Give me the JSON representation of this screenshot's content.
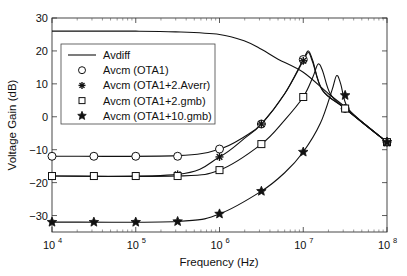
{
  "chart_data": {
    "type": "line",
    "title": "",
    "xlabel": "Frequency (Hz)",
    "ylabel": "Voltage Gain (dB)",
    "xscale": "log",
    "xlim": [
      10000,
      100000000
    ],
    "ylim": [
      -35,
      30
    ],
    "grid": false,
    "legend_position": "upper-left (inside)",
    "x_ticks": [
      10000,
      100000,
      1000000,
      10000000,
      100000000
    ],
    "x_tick_labels": [
      "10^4",
      "10^5",
      "10^6",
      "10^7",
      "10^8"
    ],
    "y_ticks": [
      -30,
      -20,
      -10,
      0,
      10,
      20,
      30
    ],
    "y_tick_labels": [
      "-30",
      "-20",
      "-10",
      "0",
      "10",
      "20",
      "30"
    ],
    "marker_x": [
      10000,
      31623,
      100000,
      316228,
      1000000,
      3162278,
      10000000,
      31622777,
      100000000
    ],
    "series": [
      {
        "name": "Avdiff",
        "marker": "none",
        "curve": [
          [
            10000,
            26
          ],
          [
            100000,
            26
          ],
          [
            300000,
            25.8
          ],
          [
            1000000,
            25
          ],
          [
            2000000,
            23
          ],
          [
            3162278,
            20.5
          ],
          [
            5000000,
            17.5
          ],
          [
            10000000,
            13.5
          ],
          [
            20000000,
            7
          ],
          [
            31622777,
            3
          ],
          [
            50000000,
            -1.5
          ],
          [
            100000000,
            -7.7
          ]
        ]
      },
      {
        "name": "Avcm (OTA1)",
        "marker": "circle",
        "values": [
          -12,
          -12,
          -12,
          -12,
          -9.8,
          -2.2,
          17.4,
          2.5,
          -7.7
        ],
        "curve": [
          [
            10000,
            -12
          ],
          [
            316228,
            -11.8
          ],
          [
            1000000,
            -9.8
          ],
          [
            2000000,
            -6
          ],
          [
            3162278,
            -2.2
          ],
          [
            6000000,
            7
          ],
          [
            10000000,
            17.4
          ],
          [
            11500000,
            20
          ],
          [
            13000000,
            17
          ],
          [
            17000000,
            8
          ],
          [
            31622777,
            2.5
          ],
          [
            100000000,
            -7.7
          ]
        ]
      },
      {
        "name": "Avcm (OTA1+2.Averr)",
        "marker": "asterisk",
        "values": [
          -18,
          -18,
          -18,
          -17.5,
          -12.2,
          -2.2,
          17,
          2.5,
          -7.7
        ],
        "curve": [
          [
            10000,
            -18
          ],
          [
            316228,
            -17.5
          ],
          [
            1000000,
            -12.2
          ],
          [
            2000000,
            -6.5
          ],
          [
            3162278,
            -2.2
          ],
          [
            6000000,
            7
          ],
          [
            10000000,
            17
          ],
          [
            11500000,
            19.5
          ],
          [
            13000000,
            16.5
          ],
          [
            17000000,
            8
          ],
          [
            31622777,
            2.5
          ],
          [
            100000000,
            -7.7
          ]
        ]
      },
      {
        "name": "Avcm (OTA1+2.gmb)",
        "marker": "square",
        "values": [
          -18,
          -18,
          -18,
          -18,
          -16.2,
          -8.3,
          6,
          2.5,
          -7.7
        ],
        "curve": [
          [
            10000,
            -18
          ],
          [
            316228,
            -18
          ],
          [
            1000000,
            -16.2
          ],
          [
            3162278,
            -8.3
          ],
          [
            6000000,
            -1
          ],
          [
            10000000,
            6
          ],
          [
            13000000,
            12
          ],
          [
            15000000,
            16
          ],
          [
            17000000,
            14
          ],
          [
            21000000,
            7
          ],
          [
            31622777,
            2.5
          ],
          [
            100000000,
            -7.7
          ]
        ]
      },
      {
        "name": "Avcm (OTA1+10.gmb)",
        "marker": "star",
        "values": [
          -32,
          -32,
          -32,
          -31.8,
          -29.5,
          -22.6,
          -10.7,
          6.5,
          -7.7
        ],
        "curve": [
          [
            10000,
            -32
          ],
          [
            316228,
            -31.8
          ],
          [
            1000000,
            -29.5
          ],
          [
            3162278,
            -22.6
          ],
          [
            6000000,
            -17
          ],
          [
            10000000,
            -10.7
          ],
          [
            16000000,
            -2
          ],
          [
            22000000,
            8
          ],
          [
            25000000,
            12.5
          ],
          [
            28000000,
            10
          ],
          [
            31622777,
            4.5
          ],
          [
            40000000,
            0.5
          ],
          [
            100000000,
            -7.7
          ]
        ]
      }
    ]
  }
}
